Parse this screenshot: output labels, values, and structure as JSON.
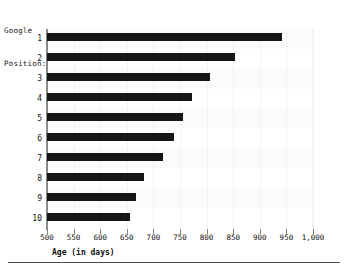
{
  "chart_data": {
    "type": "bar",
    "orientation": "horizontal",
    "title": "",
    "ylabel": "Google Position:",
    "xlabel": "Age (in days)",
    "categories": [
      "1",
      "2",
      "3",
      "4",
      "5",
      "6",
      "7",
      "8",
      "9",
      "10"
    ],
    "values": [
      942,
      853,
      807,
      773,
      756,
      739,
      718,
      682,
      667,
      656
    ],
    "xlim": [
      500,
      1000
    ],
    "xticks": [
      500,
      550,
      600,
      650,
      700,
      750,
      800,
      850,
      900,
      950,
      1000
    ],
    "xtick_labels": [
      "500",
      "550",
      "600",
      "650",
      "700",
      "750",
      "800",
      "850",
      "900",
      "950",
      "1,000"
    ],
    "grid": true,
    "legend": null,
    "bar_color": "#161616",
    "background_color": "#ffffff",
    "axis_color": "#8a8a8a"
  },
  "caption": {
    "line1": "Google",
    "line2": "Position:"
  },
  "xaxis": {
    "title": "Age (in days)"
  }
}
